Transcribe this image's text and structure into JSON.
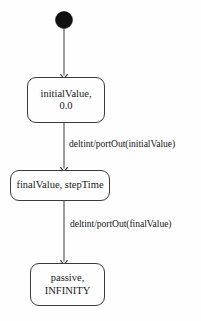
{
  "diagram": {
    "type": "uml-state-machine",
    "title": "",
    "background_color": "#fefefe",
    "stroke_color": "#3b3b3b",
    "text_color": "#181818",
    "initial_state": {
      "name": "initial-state-marker",
      "shape": "filled-circle",
      "fill_color": "#111111",
      "cx": 64,
      "cy": 20,
      "r": 8.5
    },
    "states": [
      {
        "id": "state-initial-value",
        "lines": [
          "initialValue,",
          "0.0"
        ]
      },
      {
        "id": "state-final-value",
        "lines": [
          "finalValue, stepTime"
        ]
      },
      {
        "id": "state-passive",
        "lines": [
          "passive,",
          "INFINITY"
        ]
      }
    ],
    "transitions": [
      {
        "id": "transition-initial-to-final",
        "label": "deltint/portOut(initialValue)",
        "from": "state-initial-value",
        "to": "state-final-value"
      },
      {
        "id": "transition-final-to-passive",
        "label": "deltint/portOut(finalValue)",
        "from": "state-final-value",
        "to": "state-passive"
      }
    ]
  }
}
